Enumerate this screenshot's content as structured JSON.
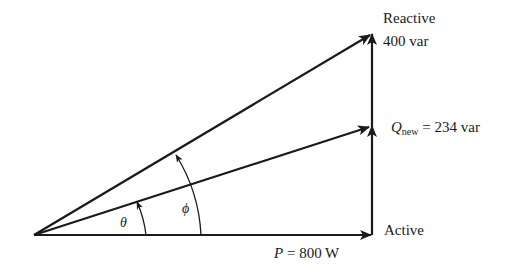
{
  "diagram": {
    "type": "power-triangle",
    "labels": {
      "reactive_axis": "Reactive",
      "reactive_value": "400 var",
      "q_new_symbol": "Q",
      "q_new_subscript": "new",
      "q_new_value": " = 234 var",
      "active_axis": "Active",
      "p_symbol": "P",
      "p_value": " = 800 W",
      "theta": "θ",
      "phi": "ϕ"
    },
    "values": {
      "P_W": 800,
      "Q_original_var": 400,
      "Q_new_var": 234
    },
    "colors": {
      "line": "#1a1a1a",
      "background": "#ffffff"
    }
  }
}
